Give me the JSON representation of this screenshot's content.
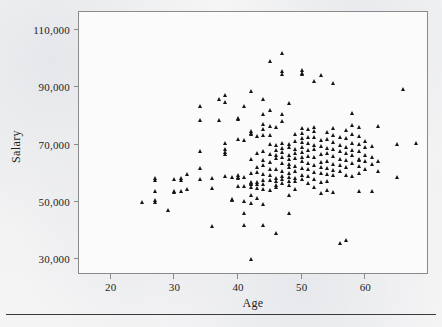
{
  "chart_data": {
    "type": "scatter",
    "title": "",
    "xlabel": "Age",
    "ylabel": "Salary",
    "xlim": [
      15,
      70
    ],
    "ylim": [
      24000,
      116000
    ],
    "xticks": [
      20,
      30,
      40,
      50,
      60
    ],
    "xtick_labels": [
      "20",
      "30",
      "40",
      "50",
      "60"
    ],
    "yticks": [
      30000,
      50000,
      70000,
      90000,
      110000
    ],
    "ytick_labels": [
      "30,000",
      "50,000",
      "70,000",
      "90,000",
      "110,000"
    ],
    "grid": false,
    "legend": false,
    "marker": "triangle",
    "marker_color": "#141414",
    "frame_color": "#8a8a8a",
    "series_name": "Employees",
    "n_points": 253,
    "points": [
      [
        25,
        49500
      ],
      [
        27,
        57800
      ],
      [
        27,
        57200
      ],
      [
        27,
        53400
      ],
      [
        27,
        50200
      ],
      [
        27,
        49600
      ],
      [
        29,
        46800
      ],
      [
        30,
        57400
      ],
      [
        30,
        53400
      ],
      [
        30,
        53100
      ],
      [
        31,
        57900
      ],
      [
        31,
        57300
      ],
      [
        31,
        53500
      ],
      [
        32,
        54200
      ],
      [
        32,
        59400
      ],
      [
        34,
        83000
      ],
      [
        34,
        78200
      ],
      [
        34,
        61500
      ],
      [
        34,
        57700
      ],
      [
        34,
        67500
      ],
      [
        36,
        41200
      ],
      [
        36,
        58000
      ],
      [
        36,
        54500
      ],
      [
        37,
        78200
      ],
      [
        37,
        85700
      ],
      [
        38,
        86800
      ],
      [
        38,
        84400
      ],
      [
        38,
        70300
      ],
      [
        38,
        68200
      ],
      [
        38,
        67000
      ],
      [
        38,
        66400
      ],
      [
        38,
        58600
      ],
      [
        39,
        58100
      ],
      [
        39,
        50600
      ],
      [
        39,
        50100
      ],
      [
        40,
        78800
      ],
      [
        40,
        78400
      ],
      [
        40,
        71500
      ],
      [
        40,
        58800
      ],
      [
        40,
        58400
      ],
      [
        40,
        57900
      ],
      [
        40,
        55100
      ],
      [
        41,
        83000
      ],
      [
        41,
        71300
      ],
      [
        41,
        58200
      ],
      [
        41,
        55000
      ],
      [
        41,
        49800
      ],
      [
        41,
        45800
      ],
      [
        41,
        41400
      ],
      [
        42,
        88200
      ],
      [
        42,
        74200
      ],
      [
        42,
        73800
      ],
      [
        42,
        73400
      ],
      [
        42,
        64500
      ],
      [
        42,
        59800
      ],
      [
        42,
        56600
      ],
      [
        42,
        56100
      ],
      [
        42,
        55700
      ],
      [
        42,
        54800
      ],
      [
        42,
        52000
      ],
      [
        42,
        49200
      ],
      [
        42,
        29600
      ],
      [
        43,
        72600
      ],
      [
        43,
        66800
      ],
      [
        43,
        61900
      ],
      [
        43,
        59900
      ],
      [
        43,
        56500
      ],
      [
        43,
        55800
      ],
      [
        43,
        54400
      ],
      [
        43,
        50900
      ],
      [
        44,
        85500
      ],
      [
        44,
        80200
      ],
      [
        44,
        76700
      ],
      [
        44,
        75100
      ],
      [
        44,
        73000
      ],
      [
        44,
        67400
      ],
      [
        44,
        64100
      ],
      [
        44,
        62300
      ],
      [
        44,
        59200
      ],
      [
        44,
        57300
      ],
      [
        44,
        55900
      ],
      [
        44,
        54000
      ],
      [
        44,
        48800
      ],
      [
        44,
        41300
      ],
      [
        45,
        98700
      ],
      [
        45,
        81800
      ],
      [
        45,
        76100
      ],
      [
        45,
        72800
      ],
      [
        45,
        69800
      ],
      [
        45,
        66200
      ],
      [
        45,
        63400
      ],
      [
        45,
        61200
      ],
      [
        45,
        58900
      ],
      [
        45,
        57100
      ],
      [
        45,
        53600
      ],
      [
        46,
        75900
      ],
      [
        46,
        69400
      ],
      [
        46,
        67600
      ],
      [
        46,
        65900
      ],
      [
        46,
        64800
      ],
      [
        46,
        61100
      ],
      [
        46,
        57800
      ],
      [
        46,
        56700
      ],
      [
        46,
        55400
      ],
      [
        46,
        54600
      ],
      [
        46,
        38600
      ],
      [
        47,
        101700
      ],
      [
        47,
        95400
      ],
      [
        47,
        94400
      ],
      [
        47,
        80300
      ],
      [
        47,
        77800
      ],
      [
        47,
        70100
      ],
      [
        47,
        68400
      ],
      [
        47,
        66900
      ],
      [
        47,
        65300
      ],
      [
        47,
        63200
      ],
      [
        47,
        60200
      ],
      [
        47,
        58700
      ],
      [
        47,
        57600
      ],
      [
        47,
        56300
      ],
      [
        48,
        84200
      ],
      [
        48,
        69900
      ],
      [
        48,
        68700
      ],
      [
        48,
        66100
      ],
      [
        48,
        64400
      ],
      [
        48,
        62800
      ],
      [
        48,
        61600
      ],
      [
        48,
        59600
      ],
      [
        48,
        58300
      ],
      [
        48,
        57000
      ],
      [
        48,
        55500
      ],
      [
        48,
        51800
      ],
      [
        48,
        45700
      ],
      [
        49,
        73200
      ],
      [
        49,
        70800
      ],
      [
        49,
        68100
      ],
      [
        49,
        66600
      ],
      [
        49,
        64900
      ],
      [
        49,
        62100
      ],
      [
        49,
        60400
      ],
      [
        49,
        58000
      ],
      [
        49,
        56800
      ],
      [
        49,
        53900
      ],
      [
        50,
        95600
      ],
      [
        50,
        94800
      ],
      [
        50,
        94200
      ],
      [
        50,
        75300
      ],
      [
        50,
        73600
      ],
      [
        50,
        71900
      ],
      [
        50,
        70400
      ],
      [
        50,
        68900
      ],
      [
        50,
        67100
      ],
      [
        50,
        65400
      ],
      [
        50,
        63800
      ],
      [
        50,
        61400
      ],
      [
        50,
        59100
      ],
      [
        50,
        57500
      ],
      [
        51,
        74900
      ],
      [
        51,
        72200
      ],
      [
        51,
        70000
      ],
      [
        51,
        67800
      ],
      [
        51,
        65700
      ],
      [
        51,
        63100
      ],
      [
        51,
        60900
      ],
      [
        51,
        58600
      ],
      [
        51,
        56200
      ],
      [
        52,
        91700
      ],
      [
        52,
        75700
      ],
      [
        52,
        74400
      ],
      [
        52,
        72100
      ],
      [
        52,
        69600
      ],
      [
        52,
        67900
      ],
      [
        52,
        65100
      ],
      [
        52,
        62400
      ],
      [
        52,
        60100
      ],
      [
        52,
        57400
      ],
      [
        52,
        54900
      ],
      [
        53,
        93800
      ],
      [
        53,
        71200
      ],
      [
        53,
        69100
      ],
      [
        53,
        66300
      ],
      [
        53,
        63600
      ],
      [
        53,
        61800
      ],
      [
        53,
        59500
      ],
      [
        53,
        56400
      ],
      [
        53,
        52600
      ],
      [
        54,
        73900
      ],
      [
        54,
        71600
      ],
      [
        54,
        68300
      ],
      [
        54,
        66700
      ],
      [
        54,
        63900
      ],
      [
        54,
        61300
      ],
      [
        54,
        59300
      ],
      [
        54,
        56900
      ],
      [
        54,
        53800
      ],
      [
        55,
        91100
      ],
      [
        55,
        75400
      ],
      [
        55,
        73100
      ],
      [
        55,
        70600
      ],
      [
        55,
        68000
      ],
      [
        55,
        65600
      ],
      [
        55,
        62900
      ],
      [
        55,
        60600
      ],
      [
        55,
        58800
      ],
      [
        55,
        52900
      ],
      [
        56,
        72400
      ],
      [
        56,
        69300
      ],
      [
        56,
        67200
      ],
      [
        56,
        64600
      ],
      [
        56,
        62600
      ],
      [
        56,
        60300
      ],
      [
        56,
        35300
      ],
      [
        57,
        74600
      ],
      [
        57,
        71800
      ],
      [
        57,
        68600
      ],
      [
        57,
        66500
      ],
      [
        57,
        64200
      ],
      [
        57,
        61700
      ],
      [
        57,
        59000
      ],
      [
        57,
        36200
      ],
      [
        58,
        80700
      ],
      [
        58,
        76400
      ],
      [
        58,
        73300
      ],
      [
        58,
        70200
      ],
      [
        58,
        67700
      ],
      [
        58,
        65800
      ],
      [
        58,
        63300
      ],
      [
        58,
        58500
      ],
      [
        59,
        75800
      ],
      [
        59,
        72700
      ],
      [
        59,
        69700
      ],
      [
        59,
        67300
      ],
      [
        59,
        64700
      ],
      [
        59,
        64300
      ],
      [
        59,
        62200
      ],
      [
        59,
        59700
      ],
      [
        59,
        53200
      ],
      [
        60,
        71000
      ],
      [
        60,
        68800
      ],
      [
        60,
        66000
      ],
      [
        60,
        63700
      ],
      [
        60,
        61000
      ],
      [
        61,
        69200
      ],
      [
        61,
        65200
      ],
      [
        61,
        62700
      ],
      [
        61,
        53300
      ],
      [
        62,
        76100
      ],
      [
        62,
        64000
      ],
      [
        62,
        60500
      ],
      [
        65,
        69800
      ],
      [
        65,
        58100
      ],
      [
        66,
        89200
      ],
      [
        68,
        70200
      ]
    ]
  },
  "axes": {
    "y_label": "Salary",
    "x_label": "Age"
  }
}
